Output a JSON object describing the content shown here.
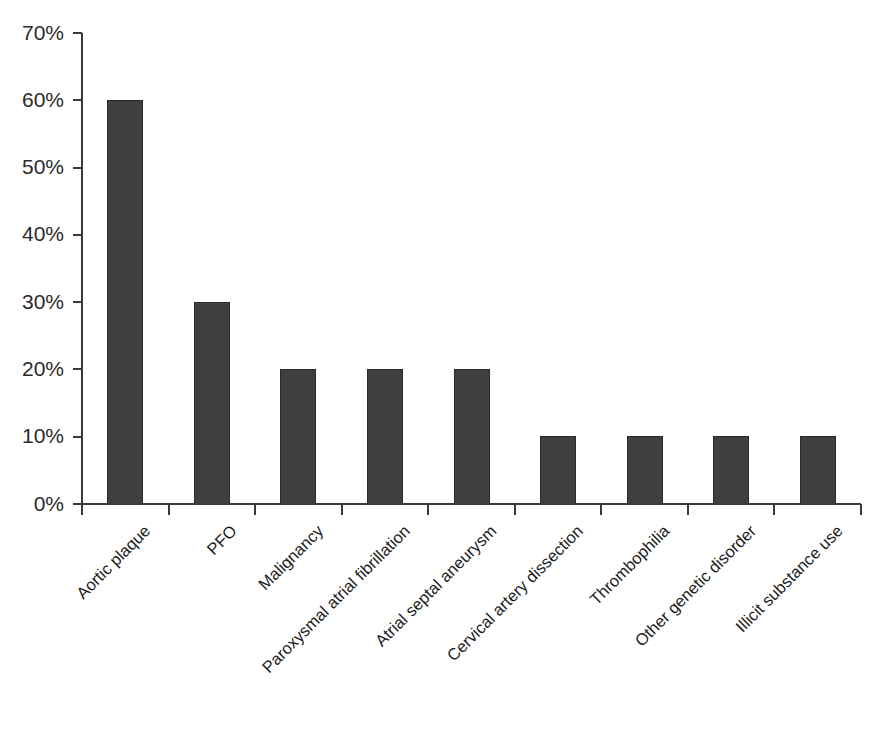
{
  "chart_data": {
    "type": "bar",
    "title": "",
    "xlabel": "",
    "ylabel": "",
    "categories": [
      "Aortic plaque",
      "PFO",
      "Malignancy",
      "Paroxysmal atrial fibrillation",
      "Atrial septal aneurysm",
      "Cervical artery dissection",
      "Thrombophilia",
      "Other genetic disorder",
      "Illicit substance use"
    ],
    "values": [
      60,
      30,
      20,
      20,
      20,
      10,
      10,
      10,
      10
    ],
    "value_unit": "%",
    "ylim": [
      0,
      70
    ],
    "ytick_values": [
      0,
      10,
      20,
      30,
      40,
      50,
      60,
      70
    ],
    "ytick_labels": [
      "0%",
      "10%",
      "20%",
      "30%",
      "40%",
      "50%",
      "60%",
      "70%"
    ],
    "grid": false,
    "legend": null,
    "legend_position": "none",
    "xtick_label_rotation_deg": -45,
    "bar_color": "#3f3f3f",
    "bar_edge_color": "#2a2a2a",
    "axis_color": "#3a3a3a",
    "background_color": "#ffffff"
  }
}
